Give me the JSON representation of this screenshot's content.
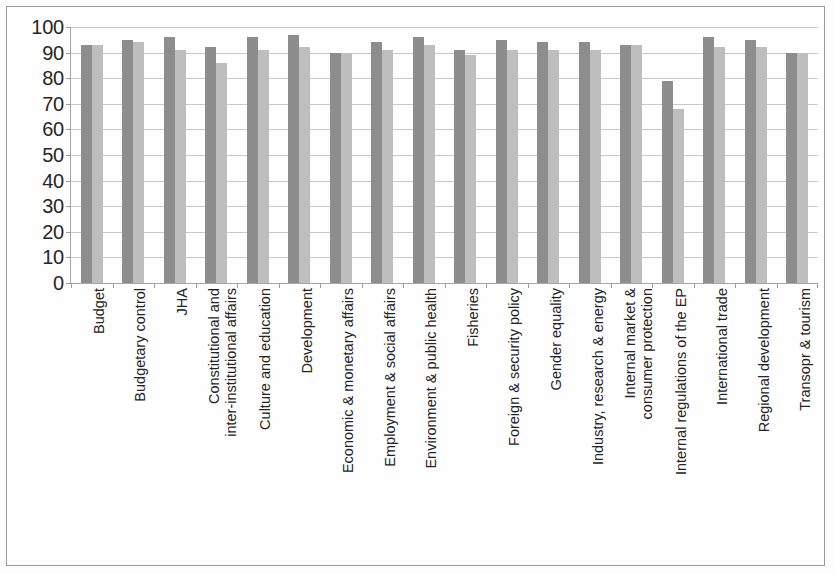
{
  "figure": {
    "background_color": "#fdfdfd",
    "border_color": "#9a9a9a",
    "series_colors": [
      "#8d8d8d",
      "#bebebe"
    ]
  },
  "chart_data": {
    "type": "bar",
    "title": "",
    "subtitle": "",
    "xlabel": "",
    "ylabel": "",
    "ylim": [
      0,
      100
    ],
    "yticks": [
      0,
      10,
      20,
      30,
      40,
      50,
      60,
      70,
      80,
      90,
      100
    ],
    "ytick_labels": [
      "0",
      "10",
      "20",
      "30",
      "40",
      "50",
      "60",
      "70",
      "80",
      "90",
      "100"
    ],
    "grid": true,
    "grid_axis": "y",
    "legend": null,
    "legend_position": "none",
    "orientation": "vertical",
    "categories": [
      "Budget",
      "Budgetary control",
      "JHA",
      "Constitutional and inter-institutional affairs",
      "Culture and education",
      "Development",
      "Economic & monetary affairs",
      "Employment & social affairs",
      "Environment & public health",
      "Fisheries",
      "Foreign & security policy",
      "Gender equality",
      "Industry, research & energy",
      "Internal market & consumer protection",
      "Internal regulations of the EP",
      "International trade",
      "Regional development",
      "Transopr & tourism"
    ],
    "category_lines": [
      [
        "Budget"
      ],
      [
        "Budgetary control"
      ],
      [
        "JHA"
      ],
      [
        "Constitutional and",
        "inter-institutional affairs"
      ],
      [
        "Culture and education"
      ],
      [
        "Development"
      ],
      [
        "Economic & monetary affairs"
      ],
      [
        "Employment & social affairs"
      ],
      [
        "Environment & public health"
      ],
      [
        "Fisheries"
      ],
      [
        "Foreign & security policy"
      ],
      [
        "Gender equality"
      ],
      [
        "Industry, research & energy"
      ],
      [
        "Internal market &",
        "consumer protection"
      ],
      [
        "Internal regulations of the EP"
      ],
      [
        "International trade"
      ],
      [
        "Regional development"
      ],
      [
        "Transopr & tourism"
      ]
    ],
    "series": [
      {
        "name": "Series 1",
        "color": "#8d8d8d",
        "values": [
          93,
          95,
          96,
          92,
          96,
          97,
          90,
          94,
          96,
          91,
          95,
          94,
          94,
          93,
          79,
          96,
          95,
          90
        ]
      },
      {
        "name": "Series 2",
        "color": "#bebebe",
        "values": [
          93,
          94,
          91,
          86,
          91,
          92,
          90,
          91,
          93,
          89,
          91,
          91,
          91,
          93,
          68,
          92,
          92,
          90
        ]
      }
    ]
  }
}
